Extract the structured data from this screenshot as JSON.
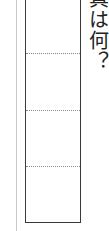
{
  "worksheet": {
    "question_text": "真は何？",
    "answer_box": {
      "rows": 4,
      "divider_positions_px": [
        53,
        110,
        166
      ]
    },
    "colors": {
      "border": "#3a3a3a",
      "divider": "#8a8a8a",
      "margin_line": "#c8c8c8",
      "text": "#222222"
    }
  }
}
